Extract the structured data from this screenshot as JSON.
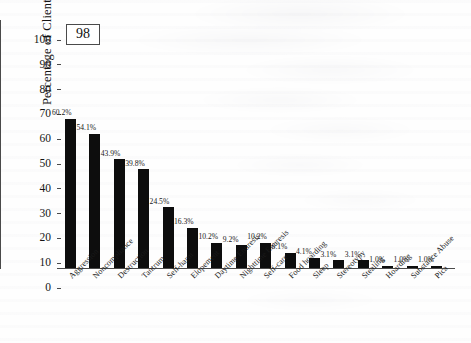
{
  "figure": {
    "number_label": "98"
  },
  "chart_data": {
    "type": "bar",
    "title": "",
    "xlabel": "",
    "ylabel": "Percentage of Clients",
    "ylim": [
      0,
      100
    ],
    "ytick_labels": [
      "0",
      "10",
      "20",
      "30",
      "40",
      "50",
      "60",
      "70",
      "80",
      "90",
      "100"
    ],
    "ytick_values": [
      0,
      10,
      20,
      30,
      40,
      50,
      60,
      70,
      80,
      90,
      100
    ],
    "grid": false,
    "legend": false,
    "bar_color": "#0d0d0d",
    "axis_color": "#4a4a4a",
    "categories": [
      "Aggression",
      "Noncompliance",
      "Destruction",
      "Tantrum",
      "Self-harm",
      "Elopement",
      "Daytime Enuresis",
      "Nighttime Enuresis",
      "Self-care",
      "Food hoarding",
      "Sleep",
      "Stereotypy",
      "Stealing",
      "Hoarding",
      "Substance Abuse",
      "Pica"
    ],
    "values": [
      60.2,
      54.1,
      43.9,
      39.8,
      24.5,
      16.3,
      10.2,
      9.2,
      10.2,
      6.1,
      4.1,
      3.1,
      3.1,
      1.0,
      1.0,
      1.0
    ],
    "data_labels": [
      "60.2%",
      "54.1%",
      "43.9%",
      "39.8%",
      "24.5%",
      "16.3%",
      "10.2%",
      "9.2%",
      "10.2%",
      "6.1%",
      "4.1%",
      "3.1%",
      "3.1%",
      "1.0%",
      "1.0%",
      "1.0%"
    ]
  }
}
